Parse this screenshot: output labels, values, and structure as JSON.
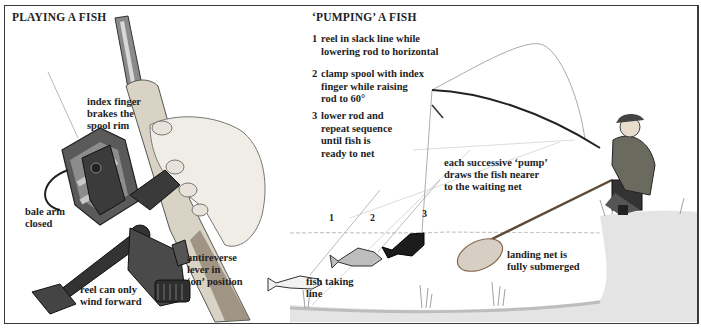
{
  "left_panel": {
    "title": "PLAYING A FISH",
    "labels": {
      "index_finger": "index finger brakes the spool rim",
      "index_finger_lines": [
        "index finger",
        "brakes the",
        "spool rim"
      ],
      "bale_arm_lines": [
        "bale arm",
        "closed"
      ],
      "antireverse_lines": [
        "antireverse",
        "lever in",
        "‘on’ position"
      ],
      "reel_forward_lines": [
        "reel can only",
        "wind forward"
      ]
    }
  },
  "right_panel": {
    "title": "‘PUMPING’ A FISH",
    "steps": [
      {
        "num": "1",
        "lines": [
          "reel in slack line while",
          "lowering rod to horizontal"
        ]
      },
      {
        "num": "2",
        "lines": [
          "clamp spool with index",
          "finger while raising",
          "rod to 60°"
        ]
      },
      {
        "num": "3",
        "lines": [
          "lower rod and",
          "repeat sequence",
          "until fish is",
          "ready to net"
        ]
      }
    ],
    "pump_note_lines": [
      "each successive ‘pump’",
      "draws the fish nearer",
      "to the waiting net"
    ],
    "stage_markers": [
      "1",
      "2",
      "3"
    ],
    "fish_taking_line_lines": [
      "fish taking",
      "line"
    ],
    "landing_net_lines": [
      "landing net is",
      "fully submerged"
    ]
  },
  "colors": {
    "border": "#3a3a3a",
    "water_line": "#c8c8c8",
    "bank": "#d9d9d9",
    "fish_dark": "#1c1c1c",
    "fish_mid": "#bdbdbd",
    "net": "#b48a6a"
  }
}
